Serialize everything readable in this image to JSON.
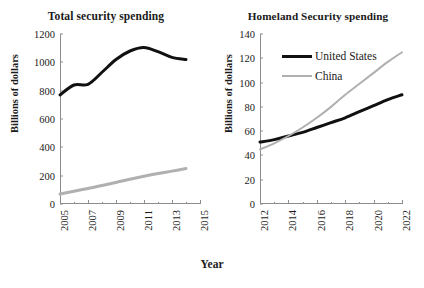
{
  "figure": {
    "xlabel": "Year",
    "ylabel_left": "Billions of dollars",
    "ylabel_right": "Billions of dollars"
  },
  "chart_data": [
    {
      "type": "line",
      "title": "Total security spending",
      "xlabel": "Year",
      "ylabel": "Billions of dollars",
      "xlim": [
        2005,
        2015
      ],
      "ylim": [
        0,
        1200
      ],
      "xticks": [
        "2005",
        "2007",
        "2009",
        "2011",
        "2013",
        "2015"
      ],
      "xtick_values": [
        2005,
        2007,
        2009,
        2011,
        2013,
        2015
      ],
      "xminor_ticks": [
        2006,
        2008,
        2010,
        2012,
        2014
      ],
      "yticks": [
        "0",
        "200",
        "400",
        "600",
        "800",
        "1000",
        "1200"
      ],
      "ytick_values": [
        0,
        200,
        400,
        600,
        800,
        1000,
        1200
      ],
      "grid": false,
      "legend": "none",
      "x": [
        2005,
        2006,
        2007,
        2008,
        2009,
        2010,
        2011,
        2012,
        2013,
        2014
      ],
      "series": [
        {
          "name": "United States",
          "color": "#111111",
          "width": 3,
          "values": [
            770,
            840,
            845,
            930,
            1020,
            1080,
            1105,
            1075,
            1035,
            1020
          ]
        },
        {
          "name": "China",
          "color": "#b0b0b0",
          "width": 3,
          "values": [
            70,
            90,
            110,
            130,
            152,
            175,
            196,
            215,
            232,
            250
          ]
        }
      ]
    },
    {
      "type": "line",
      "title": "Homeland Security spending",
      "xlabel": "Year",
      "ylabel": "Billions of dollars",
      "xlim": [
        2012,
        2022
      ],
      "ylim": [
        0,
        140
      ],
      "xticks": [
        "2012",
        "2014",
        "2016",
        "2018",
        "2020",
        "2022"
      ],
      "xtick_values": [
        2012,
        2014,
        2016,
        2018,
        2020,
        2022
      ],
      "xminor_ticks": [
        2013,
        2015,
        2017,
        2019,
        2021
      ],
      "yticks": [
        "0",
        "20",
        "40",
        "60",
        "80",
        "100",
        "120",
        "140"
      ],
      "ytick_values": [
        0,
        20,
        40,
        60,
        80,
        100,
        120,
        140
      ],
      "grid": false,
      "legend": "upper-left-inside",
      "x": [
        2012,
        2013,
        2014,
        2015,
        2016,
        2017,
        2018,
        2019,
        2020,
        2021,
        2022
      ],
      "series": [
        {
          "name": "United States",
          "color": "#111111",
          "width": 3,
          "values": [
            51,
            53,
            56,
            59,
            63,
            67,
            71,
            76,
            81,
            86,
            90
          ]
        },
        {
          "name": "China",
          "color": "#b0b0b0",
          "width": 2,
          "values": [
            45,
            50,
            56,
            63,
            71,
            80,
            90,
            99,
            108,
            117,
            125
          ]
        }
      ]
    }
  ]
}
